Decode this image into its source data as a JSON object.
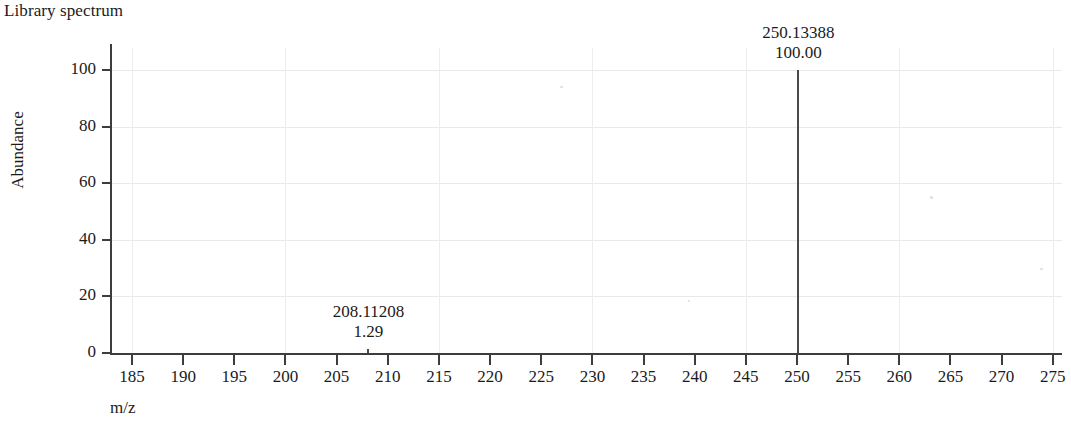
{
  "chart_title": "Library spectrum",
  "axes": {
    "x_label": "m/z",
    "y_label": "Abundance",
    "x_ticks": [
      185,
      190,
      195,
      200,
      205,
      210,
      215,
      220,
      225,
      230,
      235,
      240,
      245,
      250,
      255,
      260,
      265,
      270,
      275
    ],
    "y_ticks": [
      0,
      20,
      40,
      60,
      80,
      100
    ]
  },
  "peaks": [
    {
      "mz_label": "208.11208",
      "intensity_label": "1.29",
      "mz": 208.11208,
      "intensity": 1.29
    },
    {
      "mz_label": "250.13388",
      "intensity_label": "100.00",
      "mz": 250.13388,
      "intensity": 100.0
    }
  ],
  "colors": {
    "axis": "#3d3d3d",
    "peak": "#4a4a4a",
    "grid": "#e9e9ec",
    "text": "#1b1b1b",
    "background": "#ffffff"
  },
  "chart_data": {
    "type": "bar",
    "title": "Library spectrum",
    "xlabel": "m/z",
    "ylabel": "Abundance",
    "xlim": [
      181,
      280
    ],
    "ylim": [
      0,
      108
    ],
    "grid": true,
    "legend": "none",
    "x": [
      208.11208,
      250.13388
    ],
    "values": [
      1.29,
      100.0
    ],
    "annotations": [
      {
        "x": 208.11208,
        "y": 1.29,
        "text": "208.11208\n1.29"
      },
      {
        "x": 250.13388,
        "y": 100.0,
        "text": "250.13388\n100.00"
      }
    ]
  }
}
